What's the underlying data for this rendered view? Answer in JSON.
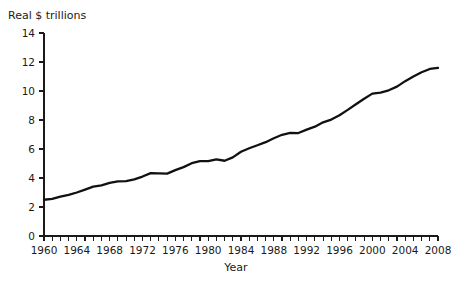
{
  "chart_data": {
    "type": "line",
    "title": "",
    "subtitle": "",
    "xlabel": "Year",
    "ylabel": "Real $ trillions",
    "xlim": [
      1960,
      2008
    ],
    "ylim": [
      0,
      14
    ],
    "grid": false,
    "legend": null,
    "y_ticks": [
      0,
      2,
      4,
      6,
      8,
      10,
      12,
      14
    ],
    "y_tick_labels": [
      "0",
      "2",
      "4",
      "6",
      "8",
      "10",
      "12",
      "14"
    ],
    "x_tick_labels": [
      "1960",
      "1964",
      "1968",
      "1972",
      "1976",
      "1980",
      "1984",
      "1988",
      "1992",
      "1996",
      "2000",
      "2004",
      "2008"
    ],
    "x_tick_step_minor": 1,
    "x_tick_step_major": 4,
    "line_color": "#111111",
    "x": [
      1960,
      1961,
      1962,
      1963,
      1964,
      1965,
      1966,
      1967,
      1968,
      1969,
      1970,
      1971,
      1972,
      1973,
      1974,
      1975,
      1976,
      1977,
      1978,
      1979,
      1980,
      1981,
      1982,
      1983,
      1984,
      1985,
      1986,
      1987,
      1988,
      1989,
      1990,
      1991,
      1992,
      1993,
      1994,
      1995,
      1996,
      1997,
      1998,
      1999,
      2000,
      2001,
      2002,
      2003,
      2004,
      2005,
      2006,
      2007,
      2008
    ],
    "values": [
      2.5,
      2.56,
      2.72,
      2.84,
      3.0,
      3.2,
      3.4,
      3.49,
      3.66,
      3.77,
      3.78,
      3.9,
      4.1,
      4.34,
      4.32,
      4.3,
      4.54,
      4.75,
      5.02,
      5.17,
      5.16,
      5.29,
      5.19,
      5.42,
      5.81,
      6.05,
      6.26,
      6.47,
      6.74,
      6.98,
      7.11,
      7.1,
      7.34,
      7.54,
      7.84,
      8.03,
      8.33,
      8.7,
      9.09,
      9.47,
      9.82,
      9.89,
      10.05,
      10.3,
      10.68,
      11.0,
      11.29,
      11.52,
      11.6
    ]
  },
  "axis": {
    "y_axis_label": "Real $ trillions",
    "x_axis_label": "Year"
  }
}
